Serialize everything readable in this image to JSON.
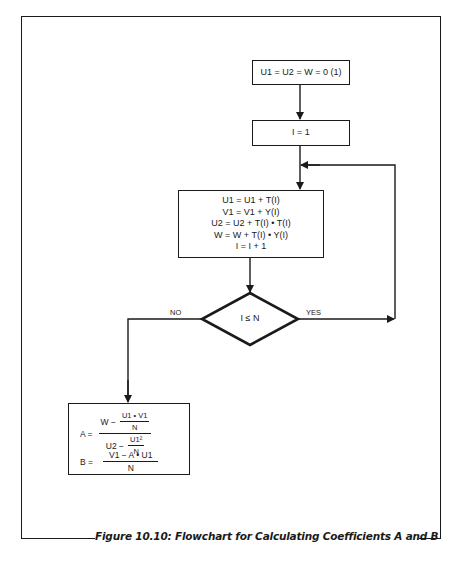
{
  "figure": {
    "caption": "Figure 10.10: Flowchart for Calculating Coefficients A and B"
  },
  "flowchart": {
    "init_box": {
      "text": "U1 = U2 = W = 0 (1)"
    },
    "counter_box": {
      "text": "I = 1"
    },
    "loop_box": {
      "lines": [
        "U1 = U1 + T(I)",
        "V1 = V1 + Y(I)",
        "U2 = U2 + T(I) • T(I)",
        "W = W + T(I) • Y(I)",
        "I = I + 1"
      ]
    },
    "decision": {
      "condition": "I ≤ N",
      "no_label": "NO",
      "yes_label": "YES"
    },
    "result_box": {
      "a_lhs": "A =",
      "a_num_prefix": "W −",
      "a_num_frac_num": "U1 • V1",
      "a_num_frac_den": "N",
      "a_den_prefix": "U2 −",
      "a_den_frac_num": "U1²",
      "a_den_frac_den": "N",
      "b_lhs": "B =",
      "b_num": "V1 − A • U1",
      "b_den": "N"
    }
  }
}
